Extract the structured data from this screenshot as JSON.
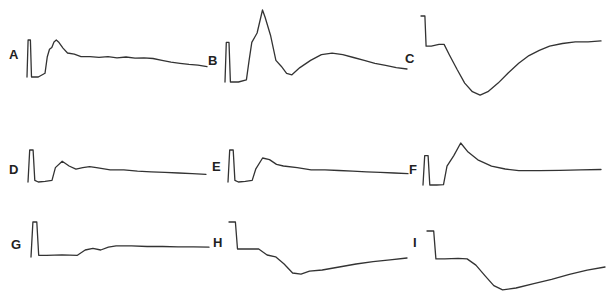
{
  "figure": {
    "trace_color": "#333333",
    "background": "#ffffff",
    "panels": [
      {
        "id": "A",
        "label": "A",
        "description": "calibration pulse then sharp rise to peak, slow decay",
        "points": [
          [
            0,
            1.0
          ],
          [
            0.5,
            0.0
          ],
          [
            1.5,
            0.0
          ],
          [
            2.0,
            1.0
          ],
          [
            5,
            1.0
          ],
          [
            8,
            0.9
          ],
          [
            9,
            0.45
          ],
          [
            10,
            0.25
          ],
          [
            11,
            0.2
          ],
          [
            12,
            0.05
          ],
          [
            13,
            0.0
          ],
          [
            14,
            0.05
          ],
          [
            16,
            0.22
          ],
          [
            18,
            0.35
          ],
          [
            21,
            0.38
          ],
          [
            24,
            0.45
          ],
          [
            28,
            0.45
          ],
          [
            32,
            0.47
          ],
          [
            36,
            0.45
          ],
          [
            40,
            0.48
          ],
          [
            44,
            0.46
          ],
          [
            48,
            0.49
          ],
          [
            52,
            0.48
          ],
          [
            56,
            0.5
          ],
          [
            60,
            0.55
          ],
          [
            64,
            0.6
          ],
          [
            68,
            0.63
          ],
          [
            72,
            0.66
          ],
          [
            76,
            0.68
          ],
          [
            80,
            0.72
          ]
        ]
      },
      {
        "id": "B",
        "label": "B",
        "description": "calibration pulse then tall narrow peak, dip, broad secondary hump",
        "points": [
          [
            0,
            1.0
          ],
          [
            0.5,
            0.45
          ],
          [
            1.5,
            0.45
          ],
          [
            2.0,
            1.0
          ],
          [
            5,
            1.0
          ],
          [
            8,
            0.97
          ],
          [
            9,
            0.7
          ],
          [
            10,
            0.45
          ],
          [
            12,
            0.32
          ],
          [
            14,
            0.0
          ],
          [
            15,
            0.1
          ],
          [
            17,
            0.35
          ],
          [
            19,
            0.7
          ],
          [
            21,
            0.78
          ],
          [
            23,
            0.88
          ],
          [
            25,
            0.9
          ],
          [
            28,
            0.8
          ],
          [
            32,
            0.7
          ],
          [
            36,
            0.62
          ],
          [
            40,
            0.6
          ],
          [
            44,
            0.62
          ],
          [
            48,
            0.66
          ],
          [
            52,
            0.7
          ],
          [
            56,
            0.74
          ],
          [
            60,
            0.77
          ],
          [
            64,
            0.8
          ],
          [
            68,
            0.82
          ]
        ]
      },
      {
        "id": "C",
        "label": "C",
        "description": "calibration pulse then deep slow trough and recovery",
        "points": [
          [
            0,
            0.0
          ],
          [
            0.5,
            0.0
          ],
          [
            1.5,
            0.0
          ],
          [
            2.0,
            0.35
          ],
          [
            4,
            0.35
          ],
          [
            7,
            0.33
          ],
          [
            9,
            0.33
          ],
          [
            11,
            0.45
          ],
          [
            14,
            0.62
          ],
          [
            17,
            0.78
          ],
          [
            20,
            0.88
          ],
          [
            23,
            0.92
          ],
          [
            26,
            0.88
          ],
          [
            30,
            0.78
          ],
          [
            34,
            0.66
          ],
          [
            38,
            0.55
          ],
          [
            42,
            0.46
          ],
          [
            46,
            0.4
          ],
          [
            50,
            0.35
          ],
          [
            55,
            0.32
          ],
          [
            60,
            0.3
          ],
          [
            65,
            0.3
          ],
          [
            70,
            0.29
          ]
        ]
      },
      {
        "id": "D",
        "label": "D",
        "description": "calibration pulse then damped oscillation",
        "points": [
          [
            0,
            1.0
          ],
          [
            0.5,
            0.0
          ],
          [
            1.5,
            0.0
          ],
          [
            2.0,
            0.95
          ],
          [
            3,
            1.0
          ],
          [
            5,
            0.98
          ],
          [
            7,
            0.95
          ],
          [
            8,
            0.55
          ],
          [
            10,
            0.35
          ],
          [
            12,
            0.5
          ],
          [
            14,
            0.6
          ],
          [
            16,
            0.55
          ],
          [
            18,
            0.52
          ],
          [
            20,
            0.55
          ],
          [
            24,
            0.62
          ],
          [
            28,
            0.62
          ],
          [
            32,
            0.66
          ],
          [
            36,
            0.68
          ],
          [
            40,
            0.7
          ],
          [
            44,
            0.72
          ],
          [
            48,
            0.74
          ],
          [
            52,
            0.76
          ]
        ]
      },
      {
        "id": "E",
        "label": "E",
        "description": "calibration pulse then rise and slow decay",
        "points": [
          [
            0,
            1.0
          ],
          [
            0.5,
            0.0
          ],
          [
            1.5,
            0.0
          ],
          [
            2.0,
            0.95
          ],
          [
            3,
            1.0
          ],
          [
            5,
            0.98
          ],
          [
            7,
            0.95
          ],
          [
            8,
            0.6
          ],
          [
            10,
            0.25
          ],
          [
            12,
            0.3
          ],
          [
            14,
            0.45
          ],
          [
            16,
            0.5
          ],
          [
            20,
            0.55
          ],
          [
            24,
            0.62
          ],
          [
            28,
            0.62
          ],
          [
            32,
            0.64
          ],
          [
            36,
            0.66
          ],
          [
            40,
            0.68
          ],
          [
            44,
            0.7
          ],
          [
            48,
            0.72
          ],
          [
            52,
            0.74
          ]
        ]
      },
      {
        "id": "F",
        "label": "F",
        "description": "calibration pulse then single sharp peak and flat baseline",
        "points": [
          [
            0,
            1.0
          ],
          [
            0.5,
            0.3
          ],
          [
            1.5,
            0.3
          ],
          [
            2.0,
            1.0
          ],
          [
            4,
            1.0
          ],
          [
            6,
            0.99
          ],
          [
            7,
            0.55
          ],
          [
            9,
            0.3
          ],
          [
            11,
            0.0
          ],
          [
            13,
            0.2
          ],
          [
            16,
            0.4
          ],
          [
            20,
            0.55
          ],
          [
            24,
            0.62
          ],
          [
            28,
            0.66
          ],
          [
            34,
            0.66
          ],
          [
            40,
            0.65
          ],
          [
            46,
            0.64
          ],
          [
            52,
            0.63
          ]
        ]
      },
      {
        "id": "G",
        "label": "G",
        "description": "calibration pulse then flat with small bumps",
        "points": [
          [
            0,
            1.0
          ],
          [
            0.5,
            0.0
          ],
          [
            1.5,
            0.0
          ],
          [
            2.0,
            0.95
          ],
          [
            4,
            0.95
          ],
          [
            8,
            0.94
          ],
          [
            12,
            0.95
          ],
          [
            14,
            0.8
          ],
          [
            16,
            0.75
          ],
          [
            18,
            0.8
          ],
          [
            20,
            0.72
          ],
          [
            22,
            0.68
          ],
          [
            26,
            0.68
          ],
          [
            30,
            0.7
          ],
          [
            34,
            0.7
          ],
          [
            38,
            0.71
          ],
          [
            42,
            0.71
          ],
          [
            46,
            0.72
          ]
        ]
      },
      {
        "id": "H",
        "label": "H",
        "description": "calibration pulse then step down into trough and gradual recovery",
        "points": [
          [
            0,
            0.0
          ],
          [
            0.5,
            0.0
          ],
          [
            1.5,
            0.0
          ],
          [
            2.0,
            0.45
          ],
          [
            4,
            0.45
          ],
          [
            7,
            0.45
          ],
          [
            9,
            0.55
          ],
          [
            11,
            0.58
          ],
          [
            13,
            0.7
          ],
          [
            15,
            0.85
          ],
          [
            17,
            0.87
          ],
          [
            19,
            0.82
          ],
          [
            22,
            0.8
          ],
          [
            26,
            0.75
          ],
          [
            30,
            0.7
          ],
          [
            34,
            0.66
          ],
          [
            38,
            0.63
          ],
          [
            42,
            0.6
          ]
        ]
      },
      {
        "id": "I",
        "label": "I",
        "description": "calibration pulse then deep trough and gradual recovery",
        "points": [
          [
            0,
            0.0
          ],
          [
            0.5,
            0.0
          ],
          [
            1.5,
            0.0
          ],
          [
            2.0,
            0.45
          ],
          [
            4,
            0.45
          ],
          [
            7,
            0.44
          ],
          [
            9,
            0.45
          ],
          [
            11,
            0.55
          ],
          [
            13,
            0.72
          ],
          [
            15,
            0.88
          ],
          [
            17,
            0.95
          ],
          [
            20,
            0.92
          ],
          [
            24,
            0.85
          ],
          [
            28,
            0.78
          ],
          [
            32,
            0.7
          ],
          [
            36,
            0.63
          ],
          [
            40,
            0.58
          ]
        ]
      }
    ]
  }
}
